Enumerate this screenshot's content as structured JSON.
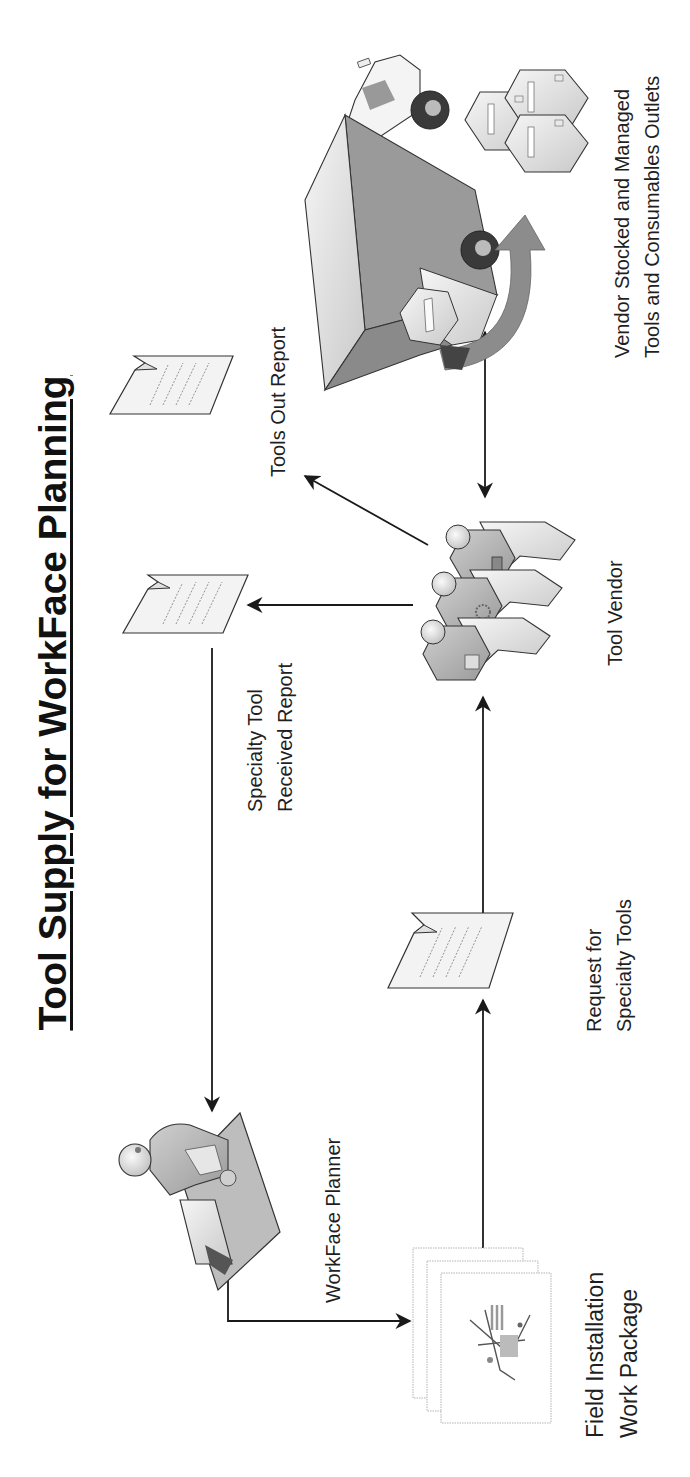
{
  "title": "Tool Supply for WorkFace Planning",
  "orientation": "rotated-90-ccw",
  "nodes": {
    "workface_planner": {
      "label": "WorkFace Planner",
      "icon": "person-at-desk-icon"
    },
    "field_installation_work_package": {
      "label_lines": [
        "Field Installation",
        "Work Package"
      ],
      "icon": "document-stack-icon"
    },
    "request_for_specialty_tools": {
      "label_lines": [
        "Request for",
        "Specialty Tools"
      ],
      "icon": "document-icon"
    },
    "specialty_tool_received_report": {
      "label_lines": [
        "Specialty Tool",
        "Received Report"
      ],
      "icon": "document-icon"
    },
    "tools_out_report": {
      "label": "Tools Out Report",
      "icon": "document-icon"
    },
    "tool_vendor": {
      "label": "Tool Vendor",
      "icon": "people-group-icon"
    },
    "vendor_outlets": {
      "label_lines": [
        "Vendor Stocked and Managed",
        "Tools and Consumables Outlets"
      ],
      "icon": "delivery-truck-icon"
    }
  },
  "edges": [
    {
      "from": "workface_planner",
      "to": "field_installation_work_package",
      "type": "arrow"
    },
    {
      "from": "field_installation_work_package",
      "to": "request_for_specialty_tools",
      "type": "arrow"
    },
    {
      "from": "request_for_specialty_tools",
      "to": "tool_vendor",
      "type": "arrow"
    },
    {
      "from": "tool_vendor",
      "to": "specialty_tool_received_report",
      "type": "arrow"
    },
    {
      "from": "tool_vendor",
      "to": "tools_out_report",
      "type": "arrow"
    },
    {
      "from": "specialty_tool_received_report",
      "to": "workface_planner",
      "type": "arrow"
    },
    {
      "from": "tool_vendor",
      "to": "vendor_outlets",
      "type": "double-arrow"
    }
  ],
  "colors": {
    "line": "#1a1a1a",
    "doc_fill": "#f3f3f3",
    "figure_light": "#e2e2e2",
    "figure_mid": "#b8b8b8",
    "figure_dark": "#7a7a7a",
    "wheel": "#3a3a3a"
  }
}
